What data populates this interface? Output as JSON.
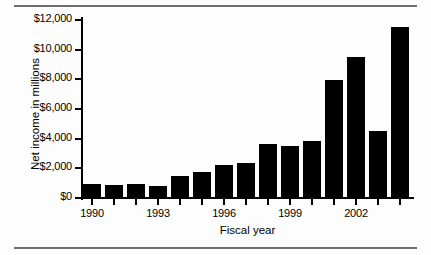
{
  "chart_data": {
    "type": "bar",
    "title": "",
    "xlabel": "Fiscal year",
    "ylabel": "Net income in millions",
    "categories": [
      "1990",
      "1991",
      "1992",
      "1993",
      "1994",
      "1995",
      "1996",
      "1997",
      "1998",
      "1999",
      "2000",
      "2001",
      "2002",
      "2003"
    ],
    "values": [
      870,
      830,
      890,
      730,
      1430,
      1690,
      2140,
      2310,
      3570,
      3420,
      3760,
      7920,
      9450,
      4430
    ],
    "values_tallest": 11490,
    "ylim": [
      0,
      12000
    ],
    "ytick_values": [
      0,
      2000,
      4000,
      6000,
      8000,
      10000,
      12000
    ],
    "ytick_labels": [
      "$0",
      "$2,000",
      "$4,000",
      "$6,000",
      "$8,000",
      "$10,000",
      "$12,000"
    ],
    "xtick_labels_shown": [
      "1990",
      "1993",
      "1996",
      "1999",
      "2002"
    ],
    "grid": false,
    "legend": false,
    "bar_color": "#000000",
    "background_color": "#fdfdfd"
  },
  "figure": {
    "rule_color": "#6e6e6e"
  },
  "bars": [
    {
      "label": "1990",
      "value": 870
    },
    {
      "label": "1991",
      "value": 830
    },
    {
      "label": "1992",
      "value": 890
    },
    {
      "label": "1993",
      "value": 730
    },
    {
      "label": "1994",
      "value": 1430
    },
    {
      "label": "1995",
      "value": 1690
    },
    {
      "label": "1996",
      "value": 2140
    },
    {
      "label": "1997",
      "value": 2310
    },
    {
      "label": "1998",
      "value": 3570
    },
    {
      "label": "1999",
      "value": 3420
    },
    {
      "label": "2000",
      "value": 3760
    },
    {
      "label": "2001",
      "value": 7920
    },
    {
      "label": "2002",
      "value": 9450
    },
    {
      "label": "2003",
      "value": 4430
    },
    {
      "label": "2004",
      "value": 11490
    }
  ]
}
